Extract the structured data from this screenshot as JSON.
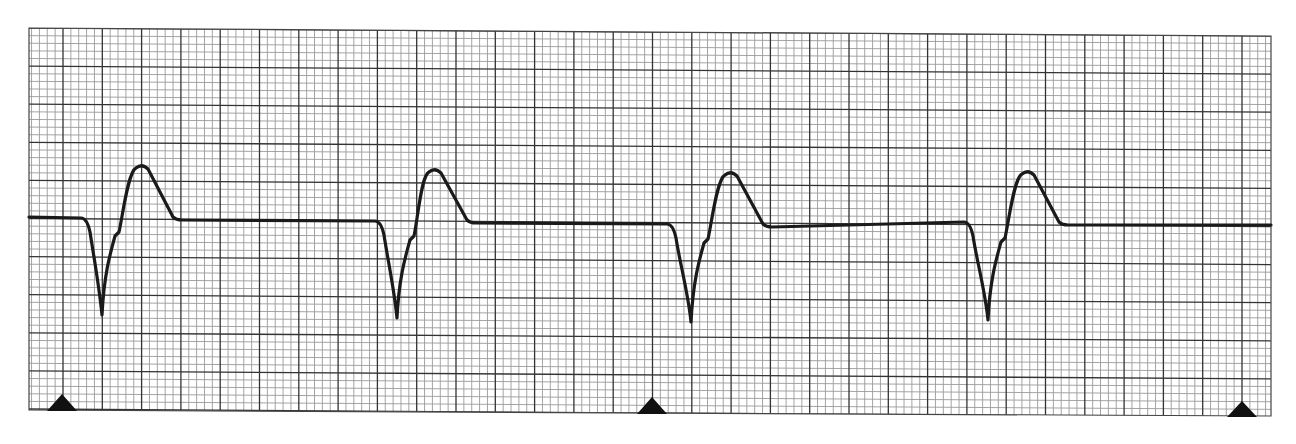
{
  "chart_data": {
    "type": "line",
    "title": "",
    "subtitle": "",
    "xlabel": "",
    "ylabel": "",
    "grid": {
      "on": true,
      "left": 29,
      "right": 1271,
      "top_left": 28,
      "top_right": 36,
      "bottom_left": 410,
      "bottom_right": 416,
      "major_spacing_x": 39.3,
      "major_spacing_y": 38.1,
      "minor_per_major": 5,
      "major_x_origin": 63,
      "major_y_origin": 28,
      "minor_color": "#9a9a9a",
      "major_color": "#333333",
      "border_color": "#444444"
    },
    "trace": {
      "color": "#1a1a1a",
      "width": 3.2,
      "baseline_start": [
        29,
        217
      ],
      "baseline_end": [
        1271,
        225
      ]
    },
    "complexes": [
      {
        "onset_x": 87,
        "baseline_y": 218,
        "min_x": 102,
        "min_y": 315,
        "notch_x": 119,
        "notch_y": 232,
        "peak_x": 142,
        "peak_y": 166,
        "end_x": 178,
        "end_y": 220
      },
      {
        "onset_x": 381,
        "baseline_y": 221,
        "min_x": 397,
        "min_y": 318,
        "notch_x": 414,
        "notch_y": 236,
        "peak_x": 435,
        "peak_y": 170,
        "end_x": 472,
        "end_y": 223
      },
      {
        "onset_x": 673,
        "baseline_y": 224,
        "min_x": 691,
        "min_y": 322,
        "notch_x": 708,
        "notch_y": 239,
        "peak_x": 731,
        "peak_y": 173,
        "end_x": 768,
        "end_y": 227
      },
      {
        "onset_x": 970,
        "baseline_y": 222,
        "min_x": 988,
        "min_y": 320,
        "notch_x": 1005,
        "notch_y": 238,
        "peak_x": 1028,
        "peak_y": 172,
        "end_x": 1064,
        "end_y": 225
      }
    ],
    "markers": [
      {
        "type": "triangle",
        "x": 62,
        "base_y": 411,
        "apex_y": 394,
        "half_width": 15
      },
      {
        "type": "triangle",
        "x": 652,
        "base_y": 414,
        "apex_y": 397,
        "half_width": 15
      },
      {
        "type": "triangle",
        "x": 1242,
        "base_y": 417,
        "apex_y": 401,
        "half_width": 15
      }
    ],
    "beat_count": 4,
    "rr_interval_px": 294,
    "x": [
      29,
      87,
      102,
      119,
      142,
      178,
      381,
      397,
      414,
      435,
      472,
      673,
      691,
      708,
      731,
      768,
      970,
      988,
      1005,
      1028,
      1064,
      1271
    ],
    "y": [
      217,
      218,
      315,
      232,
      166,
      220,
      221,
      318,
      236,
      170,
      223,
      224,
      322,
      239,
      173,
      227,
      222,
      320,
      238,
      172,
      225,
      225
    ]
  },
  "labels": {
    "strip_name": "ECG rhythm strip"
  }
}
